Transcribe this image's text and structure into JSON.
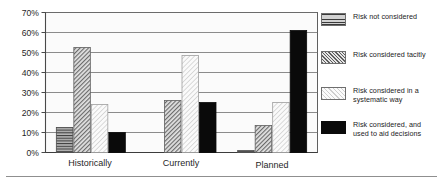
{
  "chart_data": {
    "type": "bar",
    "title": "",
    "subtitle": "",
    "xlabel": "",
    "ylabel": "",
    "categories": [
      "Historically",
      "Currently",
      "Planned"
    ],
    "series": [
      {
        "name": "Risk not considered",
        "key": "risk-not-considered",
        "pattern": "horizontal-lines",
        "values": [
          12.5,
          0,
          1
        ]
      },
      {
        "name": "Risk considered tacitly",
        "key": "risk-considered-tacitly",
        "pattern": "diagonal-hatch",
        "values": [
          52.5,
          26,
          13.5
        ]
      },
      {
        "name": "Risk considered in a\nsystematic way",
        "key": "risk-considered-systematic",
        "pattern": "light-diagonal",
        "values": [
          24,
          48.5,
          25
        ]
      },
      {
        "name": "Risk considered, and\nused to aid decisions",
        "key": "risk-considered-aid-decisions",
        "pattern": "solid-black",
        "values": [
          10,
          25,
          61
        ]
      }
    ],
    "ylim": [
      0,
      70
    ],
    "yticks": [
      0,
      10,
      20,
      30,
      40,
      50,
      60,
      70
    ],
    "ytick_labels": [
      "0%",
      "10%",
      "20%",
      "30%",
      "40%",
      "50%",
      "60%",
      "70%"
    ],
    "grid": true,
    "grid_axis": "y",
    "legend_position": "right",
    "colors": {
      "plot_background": "#fbfbfb",
      "grid": "#6b6b6b",
      "axis": "#5a5a5a",
      "solid_series": "#0a0a0a",
      "text": "#1f1f1f",
      "frame": "#8f8f8f"
    }
  },
  "legend": {
    "items": [
      {
        "label": "Risk not considered"
      },
      {
        "label": "Risk considered tacitly"
      },
      {
        "label": "Risk considered in a\nsystematic way"
      },
      {
        "label": "Risk considered, and\nused to aid decisions"
      }
    ]
  },
  "axis": {
    "y_labels": [
      "70%",
      "60%",
      "50%",
      "40%",
      "30%",
      "20%",
      "10%",
      "0%"
    ],
    "x_labels": [
      "Historically",
      "Currently",
      "Planned"
    ]
  }
}
